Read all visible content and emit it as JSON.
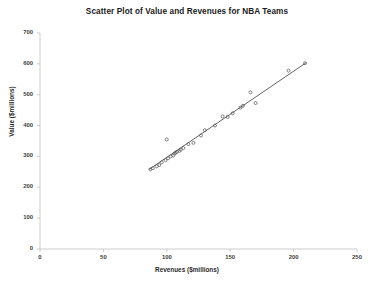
{
  "chart_data": {
    "type": "scatter",
    "title": "Scatter Plot of Value and Revenues for NBA Teams",
    "xlabel": "Revenues ($millions)",
    "ylabel": "Value ($millions)",
    "xlim": [
      0,
      250
    ],
    "ylim": [
      0,
      700
    ],
    "xticks": [
      0,
      50,
      100,
      150,
      200,
      250
    ],
    "yticks": [
      0,
      100,
      200,
      300,
      400,
      500,
      600,
      700
    ],
    "grid": false,
    "legend": "none",
    "marker_style": "open-circle",
    "marker_color": "#555555",
    "trendline": {
      "visible": true,
      "color": "#3a3a3a",
      "x_start": 86,
      "y_start": 258,
      "x_end": 210,
      "y_end": 604
    },
    "series": [
      {
        "name": "NBA Teams",
        "points": [
          {
            "x": 87,
            "y": 258
          },
          {
            "x": 89,
            "y": 262
          },
          {
            "x": 92,
            "y": 268
          },
          {
            "x": 94,
            "y": 272
          },
          {
            "x": 96,
            "y": 281
          },
          {
            "x": 99,
            "y": 288
          },
          {
            "x": 101,
            "y": 294
          },
          {
            "x": 103,
            "y": 300
          },
          {
            "x": 105,
            "y": 303
          },
          {
            "x": 106,
            "y": 309
          },
          {
            "x": 107,
            "y": 312
          },
          {
            "x": 108,
            "y": 315
          },
          {
            "x": 110,
            "y": 318
          },
          {
            "x": 111,
            "y": 322
          },
          {
            "x": 113,
            "y": 327
          },
          {
            "x": 100,
            "y": 355
          },
          {
            "x": 117,
            "y": 340
          },
          {
            "x": 121,
            "y": 344
          },
          {
            "x": 127,
            "y": 368
          },
          {
            "x": 130,
            "y": 385
          },
          {
            "x": 138,
            "y": 400
          },
          {
            "x": 144,
            "y": 430
          },
          {
            "x": 148,
            "y": 428
          },
          {
            "x": 152,
            "y": 440
          },
          {
            "x": 158,
            "y": 458
          },
          {
            "x": 160,
            "y": 464
          },
          {
            "x": 166,
            "y": 508
          },
          {
            "x": 170,
            "y": 473
          },
          {
            "x": 196,
            "y": 578
          },
          {
            "x": 209,
            "y": 602
          }
        ]
      }
    ]
  },
  "axes": {
    "y_tick_labels": [
      "700",
      "600",
      "500",
      "400",
      "300",
      "200",
      "100",
      "0"
    ],
    "x_tick_labels": [
      "0",
      "50",
      "100",
      "150",
      "200",
      "250"
    ]
  }
}
